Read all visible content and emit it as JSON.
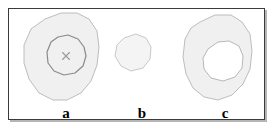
{
  "figure": {
    "background_color": "#ffffff",
    "frame": {
      "border_color": "#3a3a3a",
      "shadow_color": "#787878",
      "fill_color": "#ffffff"
    },
    "style": {
      "region_fill": "#f0f0f0",
      "region_stroke": "#b5b5b5",
      "inner_contour_stroke": "#8a8a8a",
      "hole_fill": "#ffffff",
      "marker_color": "#9a9a9a"
    },
    "panels": [
      {
        "id": "a",
        "label": "a",
        "description": "large outer region containing a nested inner contour with a center cross marker",
        "regions": [
          {
            "name": "outer-region",
            "fill": "#f0f0f0",
            "stroke": "#b5b5b5",
            "points": "36,10 52,4 68,4 80,10 88,22 90,38 88,56 82,72 72,84 58,91 44,91 30,84 20,70 15,54 15,36 22,20"
          },
          {
            "name": "inner-contour",
            "fill": "#f0f0f0",
            "stroke": "#8a8a8a",
            "points": "49,28 59,26 69,30 75,38 77,47 74,57 66,64 55,66 45,62 39,54 38,43 42,33"
          }
        ],
        "markers": [
          {
            "name": "center-cross",
            "x": 57,
            "y": 47,
            "size": 7,
            "color": "#9a9a9a"
          }
        ]
      },
      {
        "id": "b",
        "label": "b",
        "description": "small isolated region, no inner contour",
        "regions": [
          {
            "name": "outer-region",
            "fill": "#f4f4f4",
            "stroke": "#c2c2c2",
            "points": "115,29 127,25 137,29 142,38 141,50 134,59 122,62 112,57 106,47 108,36"
          }
        ],
        "markers": []
      },
      {
        "id": "c",
        "label": "c",
        "description": "large outer region with an unfilled interior hole",
        "regions": [
          {
            "name": "outer-region",
            "fill": "#f0f0f0",
            "stroke": "#b5b5b5",
            "points": "191,13 206,6 222,6 233,13 241,25 243,42 241,60 234,75 223,86 209,91 195,88 184,79 177,65 174,48 176,30 182,19"
          },
          {
            "name": "interior-hole",
            "fill": "#ffffff",
            "stroke": "#b0b0b0",
            "points": "199,40 209,33 220,32 230,37 234,47 233,59 226,68 214,72 202,69 195,60 194,49"
          }
        ],
        "markers": []
      }
    ]
  }
}
